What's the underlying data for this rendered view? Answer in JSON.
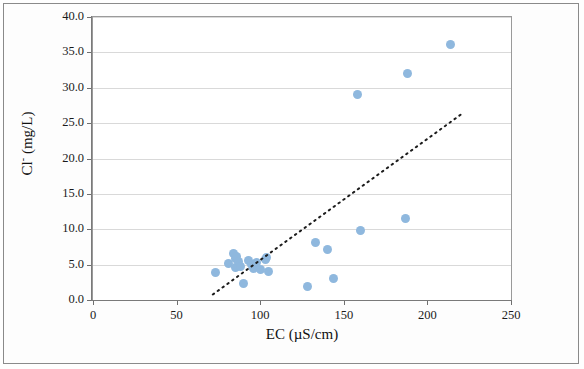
{
  "chart_data": {
    "type": "scatter",
    "title": "",
    "xlabel": "EC (µS/cm)",
    "ylabel_main": "Cl",
    "ylabel_sup": "-",
    "ylabel_rest": " (mg/L)",
    "ylabel": "Cl- (mg/L)",
    "xlim": [
      0,
      250
    ],
    "ylim": [
      0,
      40
    ],
    "xticks": [
      0,
      50,
      100,
      150,
      200,
      250
    ],
    "xtick_labels": [
      "0",
      "50",
      "100",
      "150",
      "200",
      "250"
    ],
    "yticks": [
      0,
      5,
      10,
      15,
      20,
      25,
      30,
      35,
      40
    ],
    "ytick_labels": [
      "0.0",
      "5.0",
      "10.0",
      "15.0",
      "20.0",
      "25.0",
      "30.0",
      "35.0",
      "40.0"
    ],
    "grid": "horizontal",
    "legend": "none",
    "series": [
      {
        "name": "samples",
        "marker": "circle",
        "color": "#8fb8de",
        "points": [
          {
            "x": 73,
            "y": 3.9
          },
          {
            "x": 81,
            "y": 5.2
          },
          {
            "x": 84,
            "y": 6.6
          },
          {
            "x": 85,
            "y": 5.9
          },
          {
            "x": 85,
            "y": 4.6
          },
          {
            "x": 86,
            "y": 6.2
          },
          {
            "x": 87,
            "y": 5.4
          },
          {
            "x": 88,
            "y": 4.8
          },
          {
            "x": 90,
            "y": 2.3
          },
          {
            "x": 93,
            "y": 5.6
          },
          {
            "x": 95,
            "y": 5.0
          },
          {
            "x": 96,
            "y": 4.4
          },
          {
            "x": 98,
            "y": 5.3
          },
          {
            "x": 100,
            "y": 4.3
          },
          {
            "x": 103,
            "y": 5.8
          },
          {
            "x": 104,
            "y": 6.0
          },
          {
            "x": 105,
            "y": 4.1
          },
          {
            "x": 128,
            "y": 1.9
          },
          {
            "x": 133,
            "y": 8.2
          },
          {
            "x": 140,
            "y": 7.1
          },
          {
            "x": 144,
            "y": 3.1
          },
          {
            "x": 158,
            "y": 29.1
          },
          {
            "x": 160,
            "y": 9.9
          },
          {
            "x": 187,
            "y": 11.5
          },
          {
            "x": 188,
            "y": 32.0
          },
          {
            "x": 214,
            "y": 36.1
          }
        ]
      }
    ],
    "trendline": {
      "style": "dotted",
      "color": "#1c1c1c",
      "x_start": 72,
      "y_start": 0.6,
      "x_end": 222,
      "y_end": 26.3
    }
  }
}
